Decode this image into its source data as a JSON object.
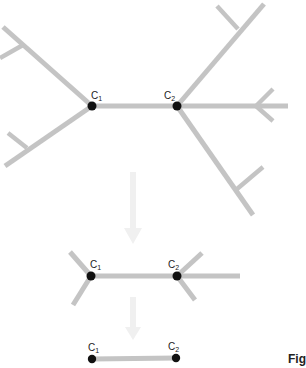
{
  "figure": {
    "caption_fragment": "Figu",
    "colors": {
      "branch": "#c4c4c4",
      "node": "#111111",
      "arrow": "#f0f0f0",
      "text": "#222222"
    },
    "stages": [
      {
        "name": "full-tree",
        "nodes": [
          {
            "label": "C",
            "subscript": "1"
          },
          {
            "label": "C",
            "subscript": "2"
          }
        ]
      },
      {
        "name": "pruned-tree",
        "nodes": [
          {
            "label": "C",
            "subscript": "1"
          },
          {
            "label": "C",
            "subscript": "2"
          }
        ]
      },
      {
        "name": "core-edge",
        "nodes": [
          {
            "label": "C",
            "subscript": "1"
          },
          {
            "label": "C",
            "subscript": "2"
          }
        ]
      }
    ],
    "arrows": [
      {
        "direction": "down",
        "from_stage": "full-tree",
        "to_stage": "pruned-tree"
      },
      {
        "direction": "down",
        "from_stage": "pruned-tree",
        "to_stage": "core-edge"
      }
    ]
  }
}
